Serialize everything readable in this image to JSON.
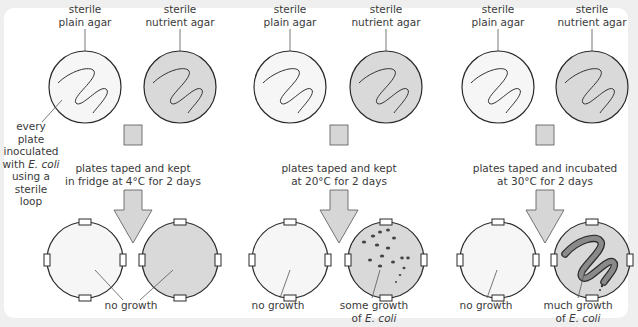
{
  "diagram": {
    "title": "",
    "colors": {
      "background": "#efefef",
      "panel": "#ffffff",
      "plain_agar_fill": "#f6f6f6",
      "nutrient_agar_fill": "#d9d9d9",
      "arrow_fill": "#d6d6d6",
      "outline": "#2a2a2a",
      "growth_dark": "#555555",
      "growth_heavy_fill": "#8a8a8a"
    },
    "side_note": {
      "line1": "every plate",
      "line2": "inoculated",
      "line3_prefix": "with ",
      "line3_italic": "E. coli",
      "line4": "using a",
      "line5": "sterile loop"
    },
    "columns": [
      {
        "plain_label_1": "sterile",
        "plain_label_2": "plain agar",
        "nutrient_label_1": "sterile",
        "nutrient_label_2": "nutrient agar",
        "condition_1": "plates taped and kept",
        "condition_2": "in fridge at 4°C for 2 days",
        "temperature_c": 4,
        "duration_days": 2,
        "result_plain": "no growth",
        "result_nutrient": "",
        "result_shared": "no growth",
        "growth_level": "none"
      },
      {
        "plain_label_1": "sterile",
        "plain_label_2": "plain agar",
        "nutrient_label_1": "sterile",
        "nutrient_label_2": "nutrient agar",
        "condition_1": "plates taped and kept",
        "condition_2": "at 20°C for 2 days",
        "temperature_c": 20,
        "duration_days": 2,
        "result_plain": "no growth",
        "result_nutrient_1": "some growth",
        "result_nutrient_2_prefix": "of ",
        "result_nutrient_2_italic": "E. coli",
        "growth_level": "some"
      },
      {
        "plain_label_1": "sterile",
        "plain_label_2": "plain agar",
        "nutrient_label_1": "sterile",
        "nutrient_label_2": "nutrient agar",
        "condition_1": "plates taped and incubated",
        "condition_2": "at 30°C for 2 days",
        "temperature_c": 30,
        "duration_days": 2,
        "result_plain": "no growth",
        "result_nutrient_1": "much growth",
        "result_nutrient_2_prefix": "of ",
        "result_nutrient_2_italic": "E. coli",
        "growth_level": "much"
      }
    ]
  }
}
